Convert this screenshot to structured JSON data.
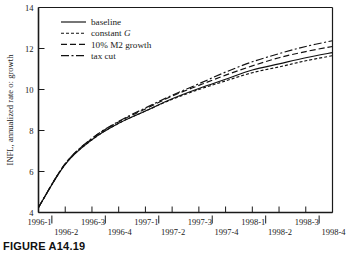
{
  "figure": {
    "caption": "FIGURE A14.19"
  },
  "chart_data": {
    "type": "line",
    "title": "",
    "xlabel": "",
    "ylabel": "INFL, annualized rate oː growth",
    "ylim": [
      4,
      14
    ],
    "yticks": [
      4,
      6,
      8,
      10,
      12,
      14
    ],
    "ytick_labels": [
      "4",
      "6",
      "8",
      "10",
      "12",
      "14"
    ],
    "grid": false,
    "legend_position": "top-left",
    "x": [
      "1996-1",
      "1996-2",
      "1996-3",
      "1996-4",
      "1997-1",
      "1997-2",
      "1997-3",
      "1997-4",
      "1998-1",
      "1998-2",
      "1998-3",
      "1998-4"
    ],
    "xtick_labels_top": [
      "1996-1",
      "1996-3",
      "1997-1",
      "1997-3",
      "1998-1",
      "1998-3"
    ],
    "xtick_labels_bottom": [
      "1996-2",
      "1996-4",
      "1997-2",
      "1997-4",
      "1998-2",
      "1998-4"
    ],
    "series": [
      {
        "name": "baseline",
        "style": "solid",
        "values": [
          4.25,
          6.35,
          7.55,
          8.35,
          8.95,
          9.55,
          10.05,
          10.5,
          10.95,
          11.25,
          11.55,
          11.8
        ]
      },
      {
        "name": "constant G",
        "style": "dotted",
        "values": [
          4.25,
          6.35,
          7.55,
          8.35,
          8.95,
          9.52,
          10.0,
          10.42,
          10.82,
          11.1,
          11.4,
          11.65
        ]
      },
      {
        "name": "10% M2 growth",
        "style": "dashed",
        "values": [
          4.25,
          6.38,
          7.6,
          8.42,
          9.05,
          9.68,
          10.2,
          10.7,
          11.15,
          11.55,
          11.85,
          12.1
        ]
      },
      {
        "name": "tax cut",
        "style": "dashdot",
        "values": [
          4.25,
          6.38,
          7.62,
          8.45,
          9.1,
          9.72,
          10.28,
          10.85,
          11.35,
          11.75,
          12.1,
          12.38
        ]
      }
    ]
  },
  "legend": {
    "items": [
      {
        "label": "baseline",
        "style": "solid",
        "italic_tail": ""
      },
      {
        "label": "constant ",
        "style": "dotted",
        "italic_tail": "G"
      },
      {
        "label": "10% M2 growth",
        "style": "dashed",
        "italic_tail": ""
      },
      {
        "label": "tax cut",
        "style": "dashdot",
        "italic_tail": ""
      }
    ]
  },
  "colors": {
    "ink": "#111111",
    "background": "#ffffff"
  }
}
